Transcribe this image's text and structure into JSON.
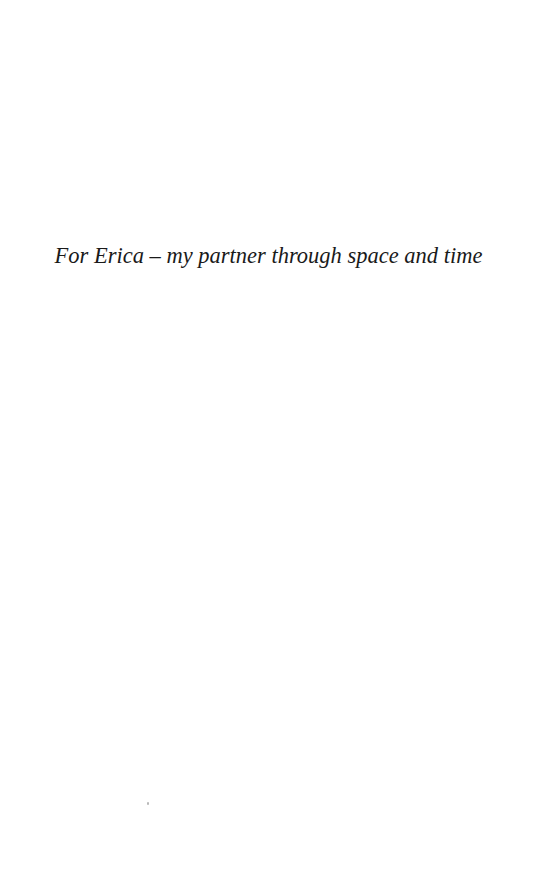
{
  "page": {
    "type": "dedication",
    "dedication_text": "For Erica – my partner through space and time"
  },
  "colors": {
    "background": "#ffffff",
    "text": "#1a1a1a"
  }
}
